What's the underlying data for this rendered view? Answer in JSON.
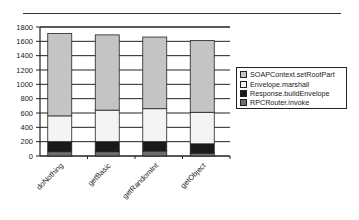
{
  "chart_data": {
    "type": "bar",
    "stacked": true,
    "title": "",
    "xlabel": "",
    "ylabel": "",
    "categories": [
      "doNothing",
      "getBasic",
      "getRandomInt",
      "getObject"
    ],
    "series": [
      {
        "name": "RPCRouter.invoke",
        "color": "#6e6e6e",
        "values": [
          60,
          60,
          70,
          40
        ]
      },
      {
        "name": "Response.buildEnvelope",
        "color": "#1a1a1a",
        "values": [
          140,
          140,
          130,
          130
        ]
      },
      {
        "name": "Envelope.marshall",
        "color": "#f4f4f4",
        "values": [
          360,
          440,
          460,
          440
        ]
      },
      {
        "name": "SOAPContext.setRootPart",
        "color": "#c4c4c4",
        "values": [
          1150,
          1050,
          1000,
          1000
        ]
      }
    ],
    "totals": [
      1710,
      1690,
      1660,
      1610
    ],
    "ylim": [
      0,
      1800
    ],
    "yticks": [
      0,
      200,
      400,
      600,
      800,
      1000,
      1200,
      1400,
      1600,
      1800
    ],
    "grid": true,
    "legend_position": "right",
    "legend_order": [
      "SOAPContext.setRootPart",
      "Envelope.marshall",
      "Response.buildEnvelope",
      "RPCRouter.invoke"
    ]
  }
}
